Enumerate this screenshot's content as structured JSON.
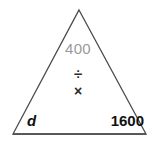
{
  "figure": {
    "kind": "formula-triangle",
    "background_color": "#ffffff",
    "outline_color": "#4a4a4a",
    "triangle": {
      "apex": {
        "x": 79,
        "y": 10
      },
      "bottom_left": {
        "x": 13,
        "y": 134
      },
      "bottom_right": {
        "x": 146,
        "y": 134
      }
    }
  },
  "labels": {
    "top_value": "400",
    "top_value_color": "#9a9a9a",
    "operator_divide": "÷",
    "operator_multiply": "×",
    "bottom_left_value": "d",
    "bottom_right_value": "1600",
    "value_color": "#111111"
  }
}
